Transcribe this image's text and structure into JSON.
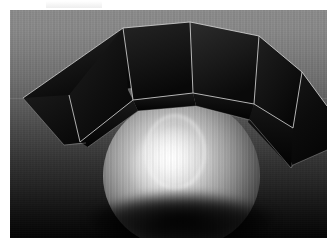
{
  "scene": {
    "title": "3D rendered scene",
    "description": "A bright illuminated sphere resting on a dark surface, encircled by a crown of dark flat polygonal panels",
    "frame": {
      "x": 10,
      "y": 10,
      "width": 317,
      "height": 228
    },
    "canvas": {
      "width": 327,
      "height": 251,
      "background": "#ffffff"
    }
  },
  "background": {
    "name": "gradient-backdrop",
    "type": "vertical-gradient",
    "top_color": "#8b8b8b",
    "mid_color": "#4a4a4a",
    "bottom_color": "#040404",
    "texture": "fine vertical striping",
    "horizon_seam_y": 88
  },
  "sphere": {
    "name": "illuminated-sphere",
    "center_x": 171,
    "center_y": 163,
    "radius_x": 78,
    "radius_y": 75,
    "highlight_color": "#ffffff",
    "midtone_color": "#a4a4a4",
    "shadow_color": "#040404",
    "features": [
      {
        "name": "specular-hotspot",
        "shape": "ellipse",
        "position": "upper-left"
      },
      {
        "name": "caustic-ring",
        "shape": "ring",
        "position": "upper-center"
      },
      {
        "name": "contact-shadow",
        "shape": "ellipse",
        "position": "below"
      }
    ]
  },
  "panels": {
    "name": "polygon-crown",
    "count": 6,
    "face_color_dark": "#090909",
    "face_color_mid": "#1e1e1e",
    "edge_color": "#dedede",
    "items": [
      {
        "id": "panel-far-left",
        "label": "Panel 1",
        "tone": "#151515"
      },
      {
        "id": "panel-left",
        "label": "Panel 2",
        "tone": "#0d0d0d"
      },
      {
        "id": "panel-center-left",
        "label": "Panel 3",
        "tone": "#1a1a1a"
      },
      {
        "id": "panel-center-right",
        "label": "Panel 4",
        "tone": "#232323"
      },
      {
        "id": "panel-right",
        "label": "Panel 5",
        "tone": "#141414"
      },
      {
        "id": "panel-far-right",
        "label": "Panel 6",
        "tone": "#0a0a0a"
      }
    ]
  },
  "artifact": {
    "name": "top-edge-artifact",
    "note": "faint light smudge near the top margin"
  }
}
